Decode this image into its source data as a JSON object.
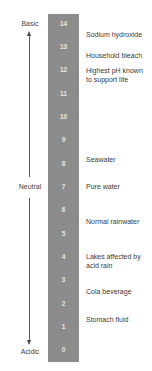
{
  "scale": {
    "numbers": [
      "14",
      "13",
      "12",
      "11",
      "10",
      "9",
      "8",
      "7",
      "6",
      "5",
      "4",
      "3",
      "2",
      "1",
      "0"
    ],
    "bar_color": "#8c8c8c"
  },
  "axis": {
    "top_label": "Basic",
    "middle_label": "Neutral",
    "bottom_label": "Acidic"
  },
  "examples": [
    {
      "ph": 14,
      "label": "Sodium hydroxide"
    },
    {
      "ph": 13,
      "label": "Household bleach"
    },
    {
      "ph": 12,
      "label": "Highest pH known to support life"
    },
    {
      "ph": 8,
      "label": "Seawater"
    },
    {
      "ph": 7,
      "label": "Pure water"
    },
    {
      "ph": 6,
      "label": "Normal rainwater"
    },
    {
      "ph": 4,
      "label": "Lakes affected by acid rain"
    },
    {
      "ph": 3,
      "label": "Cola beverage"
    },
    {
      "ph": 2,
      "label": "Stomach fluid"
    }
  ]
}
